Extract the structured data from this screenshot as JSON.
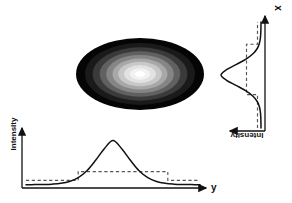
{
  "figure": {
    "kind": "beam-intensity-profile-diagram",
    "background_color": "#ffffff",
    "stroke_color": "#111111",
    "dashed_color": "#555555"
  },
  "labels": {
    "intensity_y": "Intensity",
    "intensity_x": "Intensity",
    "axis_y": "y",
    "axis_x": "x"
  },
  "spot": {
    "name": "gaussian-beam-spot",
    "center": [
      140,
      74
    ],
    "semi_axis_x": 64,
    "semi_axis_y": 36,
    "rings": [
      {
        "level": 1,
        "scale": 1.0,
        "color": "#050505"
      },
      {
        "level": 2,
        "scale": 0.86,
        "color": "#1a1a1a"
      },
      {
        "level": 3,
        "scale": 0.74,
        "color": "#3a3a3a"
      },
      {
        "level": 4,
        "scale": 0.63,
        "color": "#606060"
      },
      {
        "level": 5,
        "scale": 0.53,
        "color": "#858585"
      },
      {
        "level": 6,
        "scale": 0.43,
        "color": "#a8a8a8"
      },
      {
        "level": 7,
        "scale": 0.34,
        "color": "#c8c8c8"
      },
      {
        "level": 8,
        "scale": 0.25,
        "color": "#e2e2e2"
      },
      {
        "level": 9,
        "scale": 0.16,
        "color": "#f2f2f2"
      },
      {
        "level": 10,
        "scale": 0.08,
        "color": "#ffffff"
      }
    ]
  },
  "chart_data": [
    {
      "id": "bottom-profile",
      "type": "line",
      "title": "",
      "xlabel": "y",
      "ylabel": "Intensity",
      "orientation": "horizontal",
      "axis_origin": [
        22,
        188
      ],
      "axis_x_end": [
        208,
        188
      ],
      "axis_y_top": [
        22,
        126
      ],
      "grid": false,
      "legend": false,
      "series": [
        {
          "name": "gaussian-profile",
          "style": "solid",
          "peak_value": 1.0,
          "center_y": 0.5,
          "sigma_y": 0.135,
          "baseline": 0.04,
          "x": [
            0.0,
            0.05,
            0.1,
            0.15,
            0.2,
            0.25,
            0.3,
            0.35,
            0.4,
            0.45,
            0.5,
            0.55,
            0.6,
            0.65,
            0.7,
            0.75,
            0.8,
            0.85,
            0.9,
            0.95,
            1.0
          ],
          "values": [
            0.04,
            0.041,
            0.043,
            0.049,
            0.063,
            0.095,
            0.16,
            0.28,
            0.46,
            0.66,
            0.8,
            0.66,
            0.46,
            0.28,
            0.16,
            0.095,
            0.063,
            0.049,
            0.043,
            0.041,
            0.04
          ]
        },
        {
          "name": "step-approximation",
          "style": "dashed",
          "low_level": 0.115,
          "high_level": 0.265,
          "step_up_x": 0.3,
          "step_down_x": 0.815,
          "x": [
            0.0,
            0.3,
            0.3,
            0.815,
            0.815,
            1.0
          ],
          "values": [
            0.115,
            0.115,
            0.265,
            0.265,
            0.115,
            0.115
          ]
        }
      ],
      "xlim": [
        0,
        1
      ],
      "ylim": [
        0,
        1
      ]
    },
    {
      "id": "right-profile",
      "type": "line",
      "title": "",
      "xlabel": "Intensity",
      "ylabel": "x",
      "orientation": "vertical",
      "axis_origin": [
        265,
        131
      ],
      "axis_y_top": [
        265,
        14
      ],
      "axis_x_left": [
        228,
        131
      ],
      "grid": false,
      "legend": false,
      "series": [
        {
          "name": "gaussian-profile",
          "style": "solid",
          "peak_value": 1.0,
          "center_x": 0.5,
          "sigma_x": 0.125,
          "baseline": 0.04,
          "x": [
            0.0,
            0.05,
            0.1,
            0.15,
            0.2,
            0.25,
            0.3,
            0.35,
            0.4,
            0.45,
            0.5,
            0.55,
            0.6,
            0.65,
            0.7,
            0.75,
            0.8,
            0.85,
            0.9,
            0.95,
            1.0
          ],
          "values": [
            0.04,
            0.041,
            0.044,
            0.052,
            0.072,
            0.115,
            0.2,
            0.34,
            0.53,
            0.73,
            0.84,
            0.73,
            0.53,
            0.34,
            0.2,
            0.115,
            0.072,
            0.052,
            0.044,
            0.041,
            0.04
          ]
        },
        {
          "name": "step-approximation",
          "style": "dashed",
          "low_level": 0.11,
          "high_level": 0.33,
          "step_up_x": 0.315,
          "step_down_x": 0.79,
          "x": [
            0.0,
            0.315,
            0.315,
            0.79,
            0.79,
            1.0
          ],
          "values": [
            0.11,
            0.11,
            0.33,
            0.33,
            0.11,
            0.11
          ]
        }
      ],
      "xlim": [
        0,
        1
      ],
      "ylim": [
        0,
        1
      ]
    }
  ]
}
